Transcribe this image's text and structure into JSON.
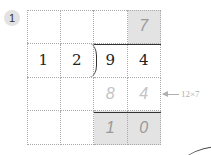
{
  "problem": {
    "number": "1",
    "divisor": [
      "1",
      "2"
    ],
    "dividend": [
      "9",
      "4"
    ],
    "quotient": [
      "",
      "",
      "",
      "7"
    ],
    "product_row": [
      "",
      "",
      "8",
      "4"
    ],
    "remainder_row": [
      "",
      "",
      "1",
      "0"
    ],
    "annotation": "12×7"
  },
  "colors": {
    "shaded_cell": "#e3e3e3",
    "handwritten": "#9a9a9a",
    "faint": "#c4c4c4"
  }
}
